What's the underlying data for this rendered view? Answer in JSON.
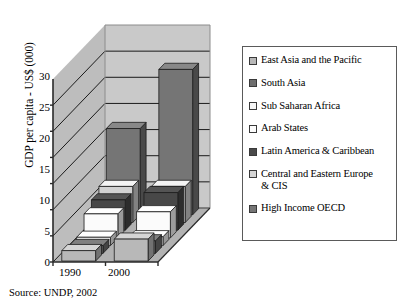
{
  "chart_data": {
    "type": "bar",
    "title": "",
    "xlabel": "",
    "ylabel": "GDP per capita - US$ (000)",
    "categories": [
      "1990",
      "2000"
    ],
    "ylim": [
      0,
      35
    ],
    "yticks": [
      0,
      5,
      10,
      15,
      20,
      25,
      30
    ],
    "ytick_labels": [
      "0",
      "5",
      "10",
      "15",
      "20",
      "25",
      "30"
    ],
    "grid": true,
    "grid_axis": "y",
    "legend_position": "right",
    "three_d": true,
    "series": [
      {
        "name": "East Asia and the Pacific",
        "color": "#b8b8b8",
        "values": [
          2.0,
          4.2
        ]
      },
      {
        "name": "South Asia",
        "color": "#6e6e6e",
        "values": [
          1.5,
          2.4
        ]
      },
      {
        "name": "Sub Saharan Africa",
        "color": "#f2f2f2",
        "values": [
          1.6,
          1.7
        ]
      },
      {
        "name": "Arab States",
        "color": "#fbfbfb",
        "values": [
          4.6,
          5.0
        ]
      },
      {
        "name": "Latin America & Caribbean",
        "color": "#484848",
        "values": [
          5.8,
          7.2
        ]
      },
      {
        "name": "Central and Eastern Europe & CIS",
        "color": "#d2d2d2",
        "values": [
          6.9,
          6.9
        ]
      },
      {
        "name": "High Income OECD",
        "color": "#757575",
        "values": [
          16.5,
          27.8
        ]
      }
    ],
    "annotations": [
      "Source: UNDP, 2002"
    ]
  },
  "axis": {
    "y_title": "GDP per capita - US$ (000)",
    "y_ticks": [
      "30",
      "25",
      "20",
      "15",
      "10",
      "5",
      "0"
    ],
    "x_ticks": [
      "1990",
      "2000"
    ]
  },
  "legend": {
    "items": [
      {
        "label": "East Asia and the Pacific",
        "color": "#b8b8b8"
      },
      {
        "label": "South Asia",
        "color": "#6e6e6e"
      },
      {
        "label": "Sub Saharan Africa",
        "color": "#f6f6f6"
      },
      {
        "label": "Arab States",
        "color": "#fcfcfc"
      },
      {
        "label": "Latin America & Caribbean",
        "color": "#4a4a4a"
      },
      {
        "label": "Central and Eastern Europe\n& CIS",
        "color": "#d4d4d4"
      },
      {
        "label": "High Income OECD",
        "color": "#767676"
      }
    ]
  },
  "source": {
    "text": "Source: UNDP, 2002"
  },
  "colors": {
    "back_wall": "#c9c9c9",
    "side_wall": "#bdbdbd",
    "floor": "#b2b2b2",
    "grid_line": "#1a1a1a",
    "axis_line": "#2a2a2a",
    "legend_border": "#5a5a5a"
  }
}
